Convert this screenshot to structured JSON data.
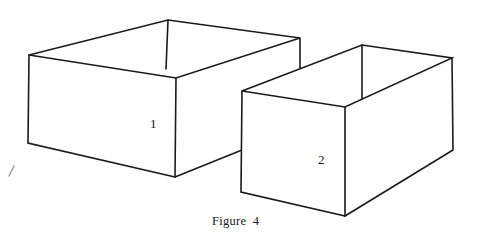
{
  "figure": {
    "caption": "Figure 4",
    "boxes": [
      {
        "id": "box-1",
        "label": "1",
        "description": "Larger open-top box, wide and shallow",
        "vertices": {
          "top_back": [
            168,
            20
          ],
          "top_left": [
            29,
            55
          ],
          "top_front": [
            176,
            78
          ],
          "top_right": [
            300,
            38
          ],
          "bottom_left": [
            28,
            143
          ],
          "bottom_front": [
            175,
            177
          ],
          "bottom_right_visible_end": [
            242,
            150
          ]
        },
        "label_pos": [
          150,
          120
        ]
      },
      {
        "id": "box-2",
        "label": "2",
        "description": "Smaller open-top box, narrow and tall",
        "vertices": {
          "top_back": [
            362,
            45
          ],
          "top_left": [
            242,
            91
          ],
          "top_front": [
            345,
            107
          ],
          "top_right": [
            452,
            58
          ],
          "back_inner_bottom": [
            362,
            99
          ],
          "bottom_left": [
            241,
            192
          ],
          "bottom_front": [
            345,
            216
          ],
          "bottom_right": [
            453,
            150
          ]
        },
        "label_pos": [
          318,
          156
        ]
      }
    ],
    "stray_mark": [
      [
        9,
        176
      ],
      [
        14,
        166
      ]
    ],
    "colors": {
      "line": "#1a1a1a",
      "background": "#ffffff"
    }
  }
}
